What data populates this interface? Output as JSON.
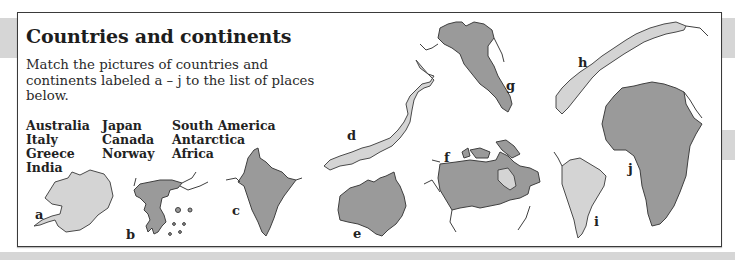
{
  "title": "Countries and continents",
  "instructions": "Match the pictures of countries and continents labeled a – j to the list of places below.",
  "places": {
    "columns": [
      [
        "Australia",
        "Italy",
        "Greece",
        "India"
      ],
      [
        "Japan",
        "Canada",
        "Norway"
      ],
      [
        "South America",
        "Antarctica",
        "Africa"
      ]
    ]
  },
  "pictures": [
    {
      "letter": "a",
      "shape": "antarctica-outline",
      "shade": "light"
    },
    {
      "letter": "b",
      "shape": "greece-outline",
      "shade": "dark"
    },
    {
      "letter": "c",
      "shape": "india-outline",
      "shade": "dark"
    },
    {
      "letter": "d",
      "shape": "japan-outline",
      "shade": "light"
    },
    {
      "letter": "e",
      "shape": "australia-outline",
      "shade": "dark"
    },
    {
      "letter": "f",
      "shape": "canada-outline",
      "shade": "dark"
    },
    {
      "letter": "g",
      "shape": "italy-outline",
      "shade": "dark"
    },
    {
      "letter": "h",
      "shape": "norway-outline",
      "shade": "light"
    },
    {
      "letter": "i",
      "shape": "south-america-outline",
      "shade": "light"
    },
    {
      "letter": "j",
      "shape": "africa-outline",
      "shade": "dark"
    }
  ],
  "colors": {
    "dark_fill": "#9a9a9a",
    "light_fill": "#d4d4d4",
    "outline": "#3f3f3f",
    "band": "#d6d6d6",
    "frame": "#3a3a3a"
  }
}
